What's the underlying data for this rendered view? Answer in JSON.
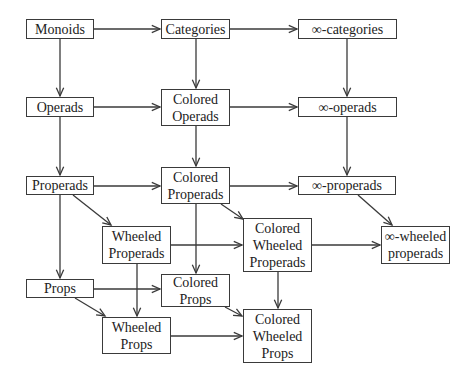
{
  "diagram": {
    "type": "directed-graph",
    "colors": {
      "stroke": "#3a3a3a",
      "text": "#222222",
      "background": "#ffffff"
    },
    "nodes": [
      {
        "id": "monoids",
        "lines": [
          "Monoids"
        ],
        "x": 26,
        "y": 19,
        "w": 68,
        "h": 20
      },
      {
        "id": "categories",
        "lines": [
          "Categories"
        ],
        "x": 161,
        "y": 19,
        "w": 69,
        "h": 20
      },
      {
        "id": "inf-categories",
        "lines": [
          "∞-categories"
        ],
        "x": 298,
        "y": 19,
        "w": 99,
        "h": 20
      },
      {
        "id": "operads",
        "lines": [
          "Operads"
        ],
        "x": 26,
        "y": 97,
        "w": 68,
        "h": 20
      },
      {
        "id": "colored-operads",
        "lines": [
          "Colored",
          "Operads"
        ],
        "x": 161,
        "y": 89,
        "w": 69,
        "h": 37
      },
      {
        "id": "inf-operads",
        "lines": [
          "∞-operads"
        ],
        "x": 298,
        "y": 97,
        "w": 99,
        "h": 20
      },
      {
        "id": "properads",
        "lines": [
          "Properads"
        ],
        "x": 26,
        "y": 176,
        "w": 68,
        "h": 19
      },
      {
        "id": "colored-properads",
        "lines": [
          "Colored",
          "Properads"
        ],
        "x": 161,
        "y": 167,
        "w": 69,
        "h": 37
      },
      {
        "id": "inf-properads",
        "lines": [
          "∞-properads"
        ],
        "x": 298,
        "y": 176,
        "w": 98,
        "h": 19
      },
      {
        "id": "wheeled-properads",
        "lines": [
          "Wheeled",
          "Properads"
        ],
        "x": 102,
        "y": 226,
        "w": 69,
        "h": 38
      },
      {
        "id": "colored-wheeled-properads",
        "lines": [
          "Colored",
          "Wheeled",
          "Properads"
        ],
        "x": 243,
        "y": 218,
        "w": 69,
        "h": 54
      },
      {
        "id": "inf-wheeled-properads",
        "lines": [
          "∞-wheeled",
          "properads"
        ],
        "x": 381,
        "y": 226,
        "w": 69,
        "h": 38
      },
      {
        "id": "props",
        "lines": [
          "Props"
        ],
        "x": 26,
        "y": 279,
        "w": 68,
        "h": 19
      },
      {
        "id": "colored-props",
        "lines": [
          "Colored",
          "Props"
        ],
        "x": 161,
        "y": 274,
        "w": 69,
        "h": 33
      },
      {
        "id": "wheeled-props",
        "lines": [
          "Wheeled",
          "Props"
        ],
        "x": 102,
        "y": 317,
        "w": 69,
        "h": 37
      },
      {
        "id": "colored-wheeled-props",
        "lines": [
          "Colored",
          "Wheeled",
          "Props"
        ],
        "x": 243,
        "y": 309,
        "w": 69,
        "h": 54
      }
    ],
    "edges": [
      {
        "from": "monoids",
        "to": "categories",
        "x1": 94,
        "y1": 29,
        "x2": 160,
        "y2": 29
      },
      {
        "from": "categories",
        "to": "inf-categories",
        "x1": 230,
        "y1": 29,
        "x2": 297,
        "y2": 29
      },
      {
        "from": "monoids",
        "to": "operads",
        "x1": 60,
        "y1": 39,
        "x2": 60,
        "y2": 96
      },
      {
        "from": "categories",
        "to": "colored-operads",
        "x1": 196,
        "y1": 39,
        "x2": 196,
        "y2": 88
      },
      {
        "from": "inf-categories",
        "to": "inf-operads",
        "x1": 347,
        "y1": 39,
        "x2": 347,
        "y2": 96
      },
      {
        "from": "operads",
        "to": "colored-operads",
        "x1": 94,
        "y1": 107,
        "x2": 160,
        "y2": 107
      },
      {
        "from": "colored-operads",
        "to": "inf-operads",
        "x1": 230,
        "y1": 107,
        "x2": 297,
        "y2": 107
      },
      {
        "from": "operads",
        "to": "properads",
        "x1": 60,
        "y1": 117,
        "x2": 60,
        "y2": 175
      },
      {
        "from": "colored-operads",
        "to": "colored-properads",
        "x1": 196,
        "y1": 126,
        "x2": 196,
        "y2": 166
      },
      {
        "from": "inf-operads",
        "to": "inf-properads",
        "x1": 347,
        "y1": 117,
        "x2": 347,
        "y2": 175
      },
      {
        "from": "properads",
        "to": "colored-properads",
        "x1": 94,
        "y1": 186,
        "x2": 160,
        "y2": 186
      },
      {
        "from": "colored-properads",
        "to": "inf-properads",
        "x1": 230,
        "y1": 186,
        "x2": 297,
        "y2": 186
      },
      {
        "from": "properads",
        "to": "wheeled-properads",
        "x1": 73,
        "y1": 195,
        "x2": 111,
        "y2": 225
      },
      {
        "from": "colored-properads",
        "to": "colored-wheeled-properads",
        "x1": 221,
        "y1": 204,
        "x2": 243,
        "y2": 219
      },
      {
        "from": "inf-properads",
        "to": "inf-wheeled-properads",
        "x1": 358,
        "y1": 195,
        "x2": 392,
        "y2": 225
      },
      {
        "from": "wheeled-properads",
        "to": "colored-wheeled-properads",
        "x1": 171,
        "y1": 245,
        "x2": 242,
        "y2": 245
      },
      {
        "from": "colored-wheeled-properads",
        "to": "inf-wheeled-properads",
        "x1": 312,
        "y1": 245,
        "x2": 380,
        "y2": 245
      },
      {
        "from": "colored-properads",
        "to": "colored-props",
        "x1": 196,
        "y1": 204,
        "x2": 196,
        "y2": 273
      },
      {
        "from": "properads",
        "to": "props",
        "x1": 60,
        "y1": 195,
        "x2": 60,
        "y2": 278
      },
      {
        "from": "wheeled-properads",
        "to": "wheeled-props",
        "x1": 137,
        "y1": 264,
        "x2": 137,
        "y2": 316
      },
      {
        "from": "props",
        "to": "colored-props",
        "x1": 94,
        "y1": 289,
        "x2": 160,
        "y2": 289
      },
      {
        "from": "props",
        "to": "wheeled-props",
        "x1": 75,
        "y1": 298,
        "x2": 105,
        "y2": 316
      },
      {
        "from": "colored-wheeled-properads",
        "to": "colored-wheeled-props",
        "x1": 278,
        "y1": 272,
        "x2": 278,
        "y2": 308
      },
      {
        "from": "colored-props",
        "to": "colored-wheeled-props",
        "x1": 225,
        "y1": 307,
        "x2": 242,
        "y2": 316
      },
      {
        "from": "wheeled-props",
        "to": "colored-wheeled-props",
        "x1": 171,
        "y1": 336,
        "x2": 242,
        "y2": 336
      }
    ]
  }
}
